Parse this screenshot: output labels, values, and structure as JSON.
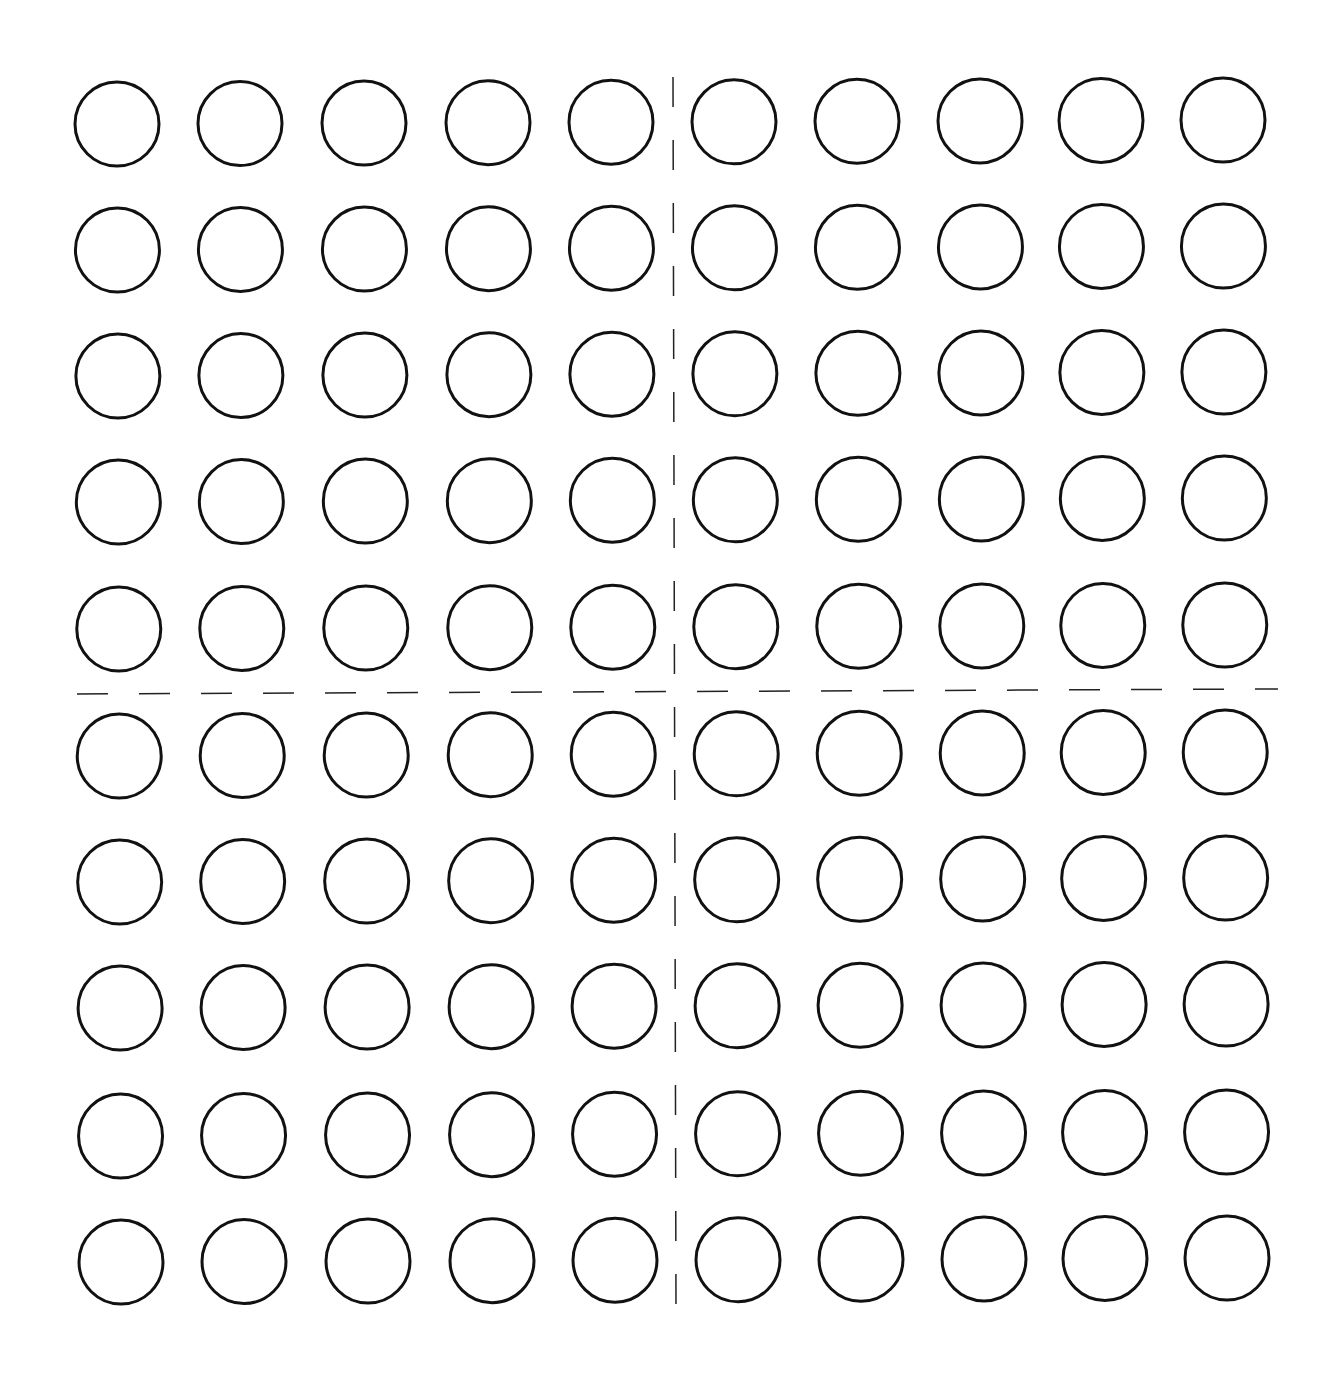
{
  "diagram": {
    "title": "",
    "type": "10x10 circle grid (hundred frame) divided into four quadrants",
    "rows": 10,
    "cols": 10,
    "circle": {
      "radius": 42,
      "stroke": "#111111",
      "stroke_width": 3,
      "fill": "#ffffff"
    },
    "col_centers": [
      117,
      240,
      364,
      488,
      611,
      734,
      857,
      980,
      1101,
      1223
    ],
    "row_centers": [
      124,
      250,
      376,
      502,
      629,
      756,
      882,
      1008,
      1136,
      1262
    ],
    "divider_vertical": {
      "x1": 673,
      "y1": 77,
      "x2": 676,
      "y2": 1307,
      "dash": [
        30,
        33
      ],
      "stroke": "#222222",
      "stroke_width": 1.5
    },
    "divider_horizontal": {
      "x1": 77,
      "y1": 694,
      "x2": 1278,
      "y2": 689,
      "dash": [
        31,
        31
      ],
      "stroke": "#222222",
      "stroke_width": 1.5
    },
    "quadrants": [
      {
        "name": "top-left",
        "circles": 25
      },
      {
        "name": "top-right",
        "circles": 25
      },
      {
        "name": "bottom-left",
        "circles": 25
      },
      {
        "name": "bottom-right",
        "circles": 25
      }
    ],
    "total_circles": 100,
    "background": "#ffffff"
  }
}
